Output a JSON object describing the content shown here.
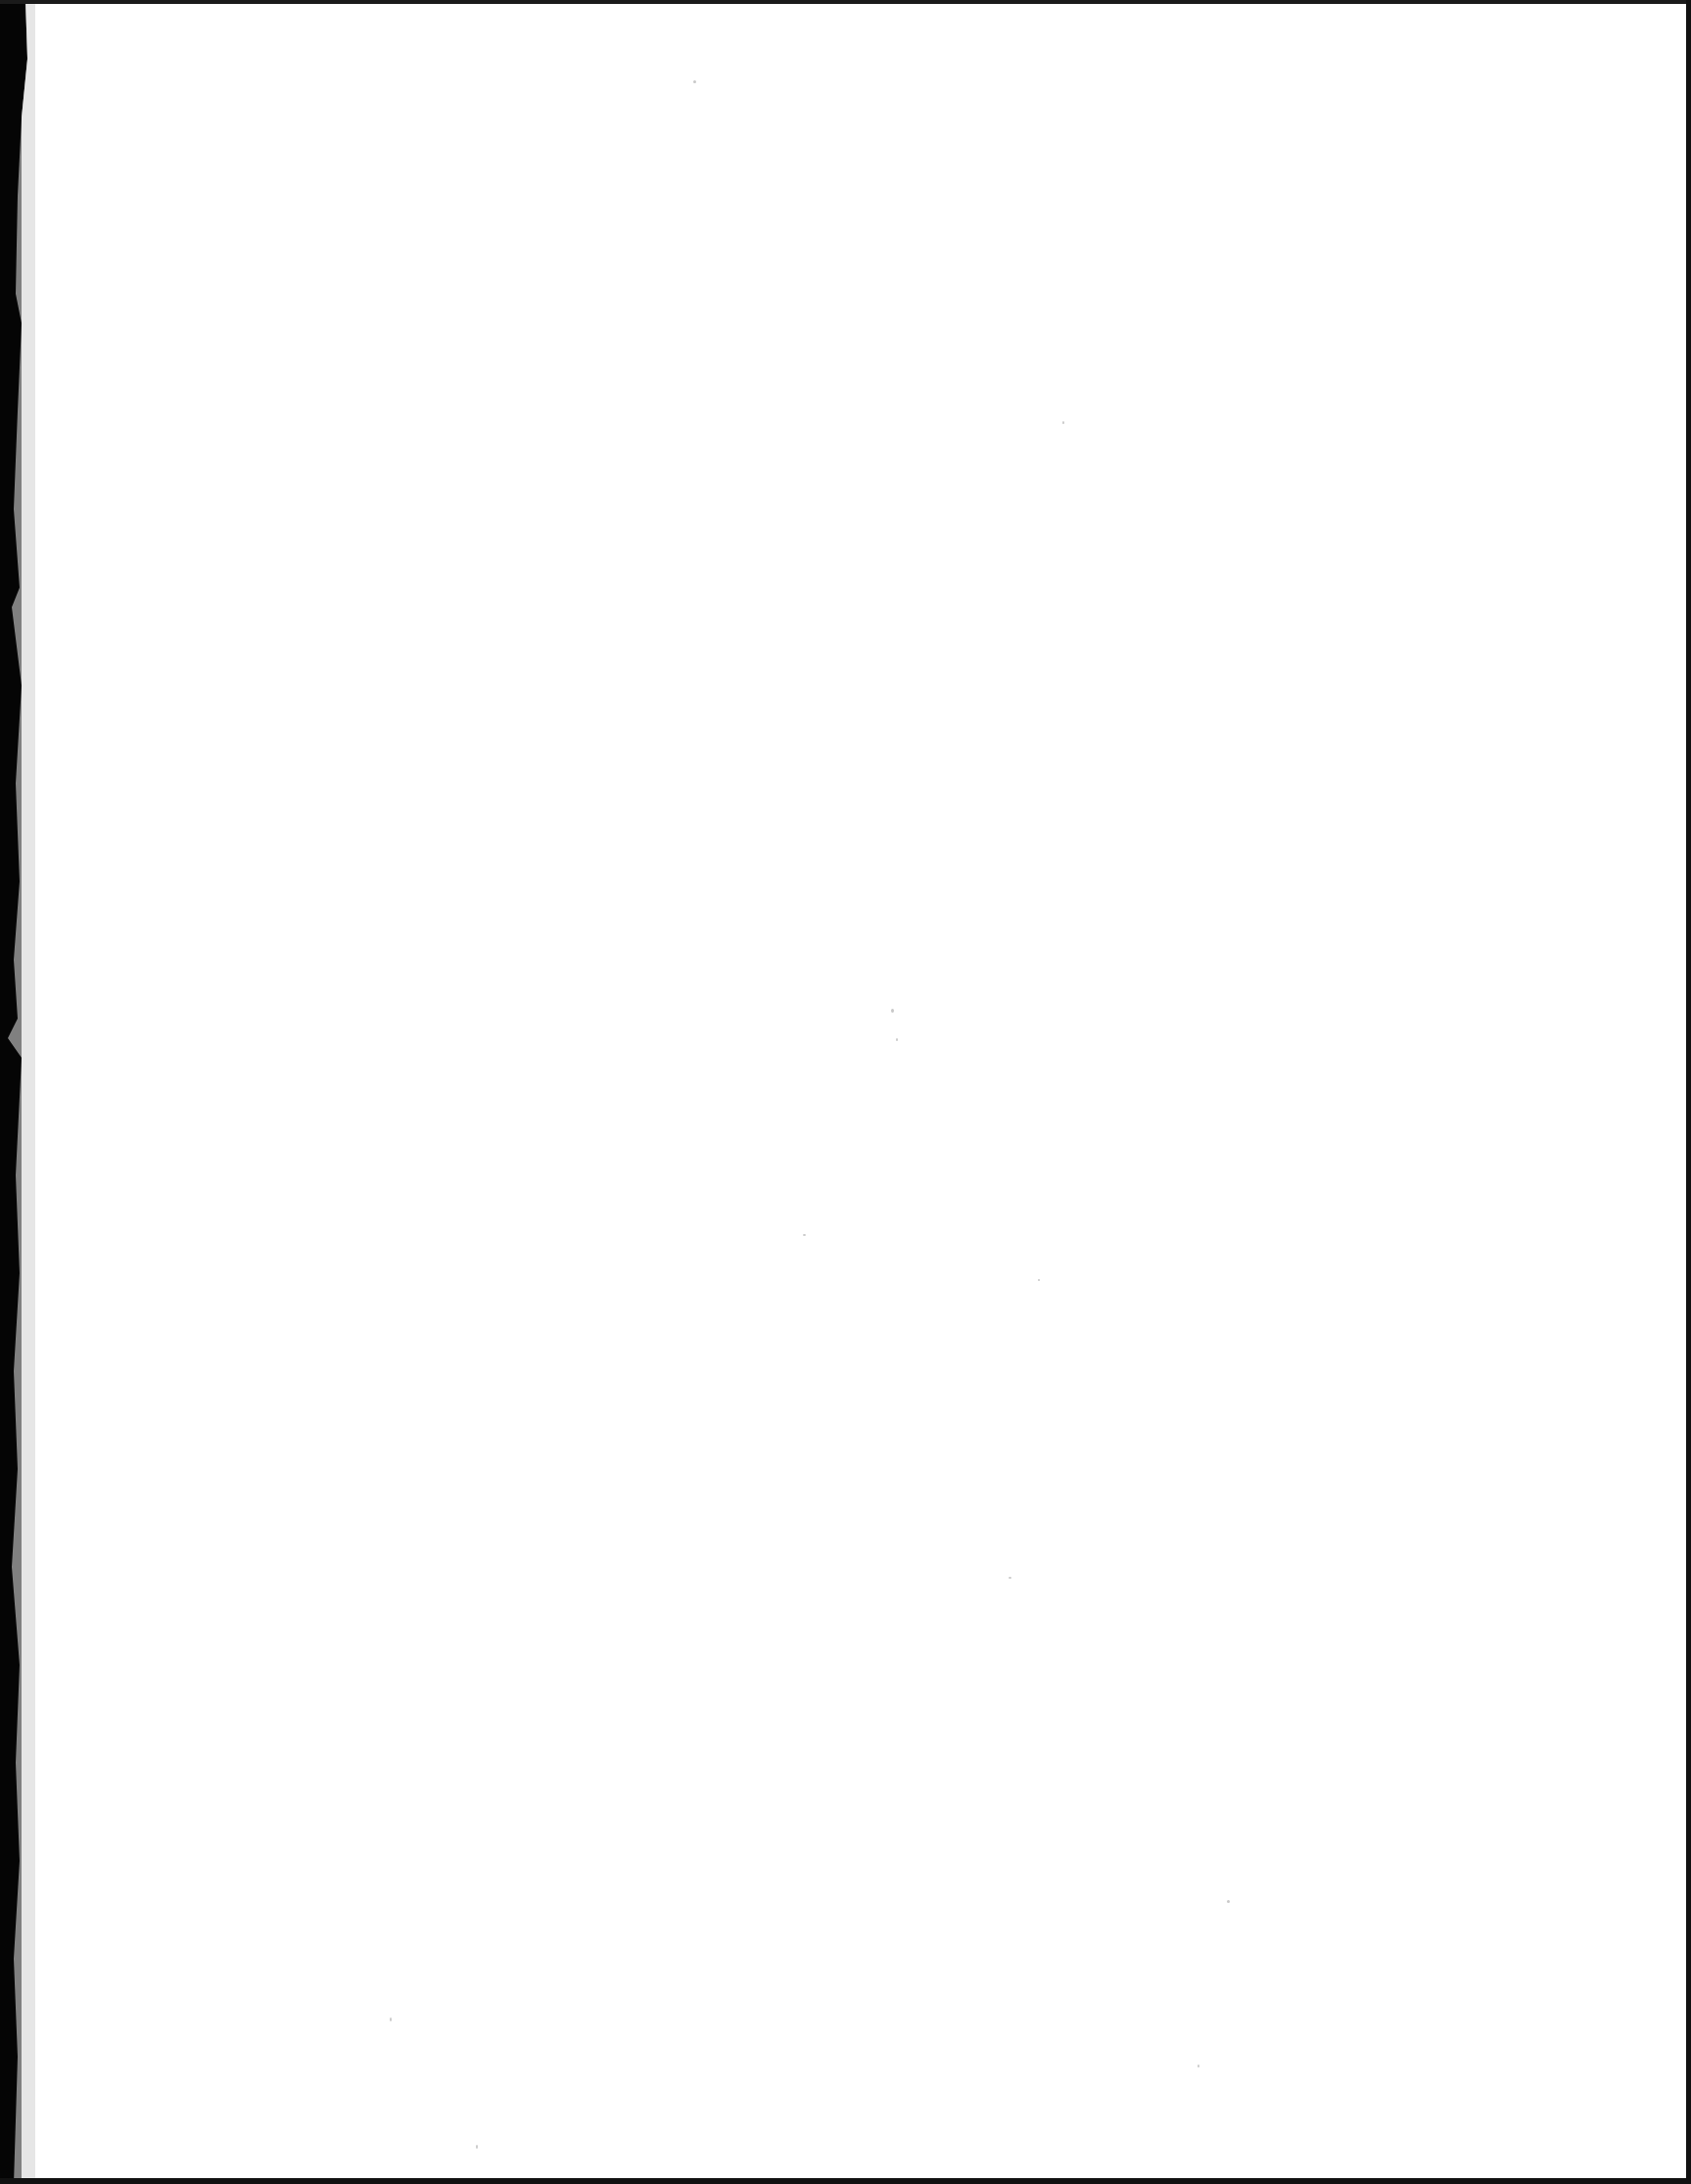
{
  "document": {
    "type": "scanned-page",
    "content": "",
    "colors": {
      "paper": "#ffffff",
      "scan_background": "#000000",
      "edge_shadow": "#c8c8c8",
      "speck": "#9a9a9a"
    }
  }
}
